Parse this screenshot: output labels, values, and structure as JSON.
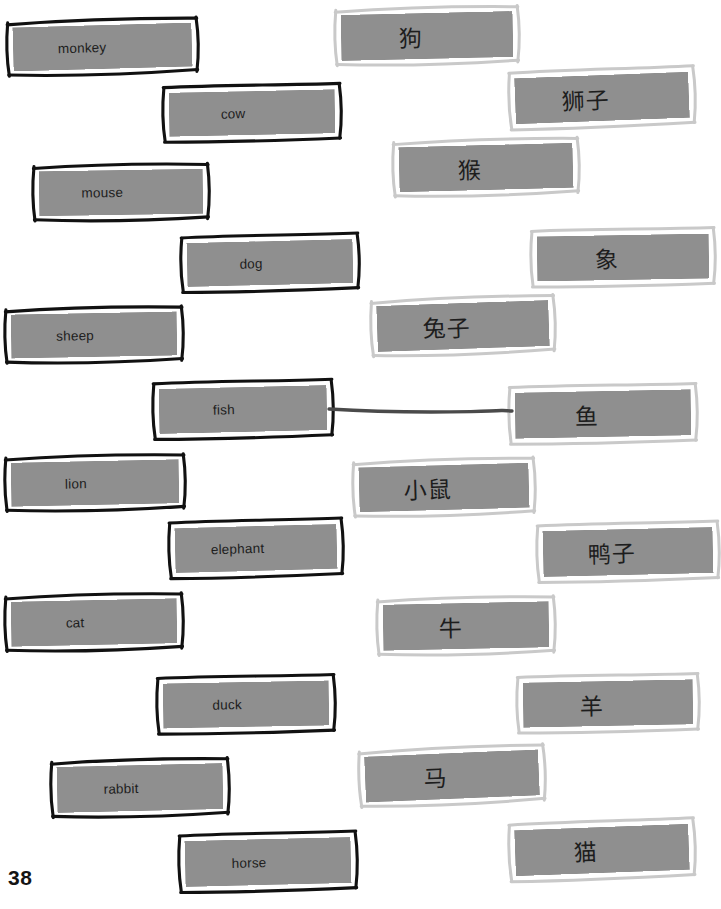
{
  "page": {
    "number": "38",
    "kind": "vocabulary-matching-worksheet",
    "background_color": "#ffffff",
    "card_fill_color": "#8f8f8f",
    "english_border_color": "#111111",
    "chinese_border_color": "#c9c9c9",
    "connector_color": "#4a4a4a",
    "text_color": "#1d1d1d"
  },
  "english_column": {
    "label": "English words",
    "items": [
      {
        "text": "monkey",
        "x": 10,
        "y": 22,
        "w": 185,
        "h": 50,
        "rot": -1.6,
        "indent": "out"
      },
      {
        "text": "cow",
        "x": 166,
        "y": 88,
        "w": 172,
        "h": 50,
        "rot": -1.2,
        "indent": "in"
      },
      {
        "text": "mouse",
        "x": 36,
        "y": 167,
        "w": 170,
        "h": 51,
        "rot": -0.9,
        "indent": "out"
      },
      {
        "text": "dog",
        "x": 184,
        "y": 238,
        "w": 172,
        "h": 50,
        "rot": -1.4,
        "indent": "in"
      },
      {
        "text": "sheep",
        "x": 8,
        "y": 310,
        "w": 172,
        "h": 50,
        "rot": -1.1,
        "indent": "out"
      },
      {
        "text": "fish",
        "x": 156,
        "y": 384,
        "w": 174,
        "h": 51,
        "rot": -1.3,
        "indent": "in"
      },
      {
        "text": "lion",
        "x": 8,
        "y": 458,
        "w": 174,
        "h": 50,
        "rot": -1.2,
        "indent": "out"
      },
      {
        "text": "elephant",
        "x": 172,
        "y": 523,
        "w": 168,
        "h": 51,
        "rot": -1.5,
        "indent": "in"
      },
      {
        "text": "cat",
        "x": 8,
        "y": 597,
        "w": 172,
        "h": 51,
        "rot": -1.2,
        "indent": "out"
      },
      {
        "text": "duck",
        "x": 160,
        "y": 679,
        "w": 172,
        "h": 51,
        "rot": -1.1,
        "indent": "in"
      },
      {
        "text": "rabbit",
        "x": 54,
        "y": 762,
        "w": 172,
        "h": 52,
        "rot": -1.3,
        "indent": "out"
      },
      {
        "text": "horse",
        "x": 182,
        "y": 836,
        "w": 172,
        "h": 52,
        "rot": -1.4,
        "indent": "in"
      }
    ]
  },
  "chinese_column": {
    "label": "Chinese words",
    "items": [
      {
        "text": "狗",
        "x": 338,
        "y": 10,
        "w": 178,
        "h": 52,
        "rot": -1.3,
        "indent": "out"
      },
      {
        "text": "狮子",
        "x": 512,
        "y": 72,
        "w": 180,
        "h": 52,
        "rot": -2.2,
        "indent": "in"
      },
      {
        "text": "猴",
        "x": 396,
        "y": 142,
        "w": 180,
        "h": 51,
        "rot": -1.5,
        "indent": "out"
      },
      {
        "text": "象",
        "x": 534,
        "y": 232,
        "w": 178,
        "h": 51,
        "rot": -1.0,
        "indent": "in"
      },
      {
        "text": "兔子",
        "x": 374,
        "y": 300,
        "w": 178,
        "h": 52,
        "rot": -2.0,
        "indent": "out"
      },
      {
        "text": "鱼",
        "x": 512,
        "y": 388,
        "w": 182,
        "h": 52,
        "rot": -1.1,
        "indent": "in"
      },
      {
        "text": "小鼠",
        "x": 356,
        "y": 462,
        "w": 176,
        "h": 51,
        "rot": -1.6,
        "indent": "out"
      },
      {
        "text": "鸭子",
        "x": 540,
        "y": 526,
        "w": 176,
        "h": 52,
        "rot": -1.4,
        "indent": "in"
      },
      {
        "text": "牛",
        "x": 380,
        "y": 600,
        "w": 172,
        "h": 52,
        "rot": -1.2,
        "indent": "out"
      },
      {
        "text": "羊",
        "x": 520,
        "y": 678,
        "w": 176,
        "h": 51,
        "rot": -1.1,
        "indent": "in"
      },
      {
        "text": "马",
        "x": 362,
        "y": 750,
        "w": 180,
        "h": 52,
        "rot": -2.4,
        "indent": "out"
      },
      {
        "text": "猫",
        "x": 512,
        "y": 824,
        "w": 180,
        "h": 52,
        "rot": -2.1,
        "indent": "in"
      }
    ]
  },
  "connections": [
    {
      "from": "fish",
      "to": "鱼",
      "x1": 329,
      "y1": 409,
      "x2": 512,
      "y2": 411
    }
  ]
}
